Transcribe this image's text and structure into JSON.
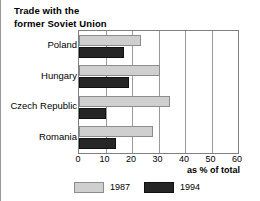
{
  "chart_data": {
    "type": "bar",
    "orientation": "horizontal",
    "title": "Trade with the\nformer Soviet Union",
    "categories": [
      "Poland",
      "Hungary",
      "Czech Republic",
      "Romania"
    ],
    "series": [
      {
        "name": "1987",
        "values": [
          23.5,
          30.5,
          34.5,
          28
        ],
        "color": "#cfcfcf"
      },
      {
        "name": "1994",
        "values": [
          17,
          19,
          10,
          14
        ],
        "color": "#262626"
      }
    ],
    "xlabel": "as % of total",
    "ylabel": "",
    "xlim": [
      0,
      60
    ],
    "xticks": [
      0,
      10,
      20,
      30,
      40,
      50,
      60
    ],
    "xtick_labels": [
      "0",
      "10",
      "20",
      "30",
      "40",
      "50",
      "60"
    ],
    "grid": true,
    "grid_axis": "x",
    "legend_position": "bottom"
  },
  "legend": {
    "entries": [
      {
        "label": "1987"
      },
      {
        "label": "1994"
      }
    ]
  }
}
